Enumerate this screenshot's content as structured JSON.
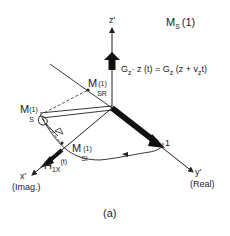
{
  "figure": {
    "panel_label": "(a)",
    "title_main": "M",
    "title_sub": "S",
    "title_arg": "(1)"
  },
  "axes": {
    "z": {
      "label": "z'"
    },
    "x": {
      "label": "x'",
      "note": "(Imag.)"
    },
    "y": {
      "label": "y'",
      "note": "(Real)"
    }
  },
  "labels": {
    "gradient_eq": "G_z · z(t) = G_z (z + v_z t)",
    "gradient_lhs_main": "G",
    "gradient_lhs_sub": "z",
    "gradient_mid": "· z (t) = G",
    "gradient_rhs_sub": "z",
    "gradient_rhs_tail_a": "(z + v",
    "gradient_rhs_tail_sub": "z",
    "gradient_rhs_tail_b": "t)",
    "msr_main": "M",
    "msr_sub": "SR",
    "msr_sup": "(1)",
    "ms_main": "M",
    "ms_sub": "S",
    "ms_sup": "(1)",
    "msi_main": "M",
    "msi_sub": "SI",
    "msi_sup": "(1)",
    "h1x_main": "H",
    "h1x_sub": "1X",
    "h1x_arg": "(t)",
    "unit_mark": "1"
  }
}
